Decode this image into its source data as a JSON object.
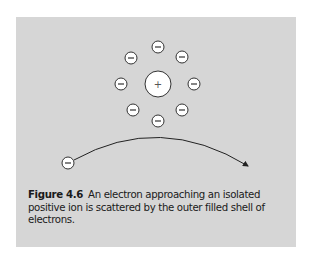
{
  "figure": {
    "label": "Figure 4.6",
    "caption": "An electron approaching an isolated positive ion is scattered by the outer filled shell of electrons.",
    "background_color": "#d6d6d6",
    "nucleus": {
      "symbol": "+",
      "cx": 158,
      "cy": 84,
      "r": 13
    },
    "shell_electrons": [
      {
        "symbol": "−",
        "cx": 158,
        "cy": 47
      },
      {
        "symbol": "−",
        "cx": 182,
        "cy": 57
      },
      {
        "symbol": "−",
        "cx": 194,
        "cy": 84
      },
      {
        "symbol": "−",
        "cx": 182,
        "cy": 110
      },
      {
        "symbol": "−",
        "cx": 158,
        "cy": 121
      },
      {
        "symbol": "−",
        "cx": 133,
        "cy": 110
      },
      {
        "symbol": "−",
        "cx": 121,
        "cy": 84
      },
      {
        "symbol": "−",
        "cx": 131,
        "cy": 58
      }
    ],
    "incoming_electron": {
      "symbol": "−",
      "cx": 68,
      "cy": 163
    },
    "trajectory": {
      "start": [
        74,
        160
      ],
      "control": [
        160,
        112
      ],
      "end": [
        248,
        166
      ]
    }
  }
}
